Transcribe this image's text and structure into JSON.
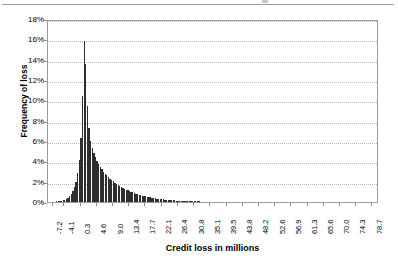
{
  "chart_data": {
    "type": "bar",
    "title": "",
    "xlabel": "Credit loss in millions",
    "ylabel": "Frequency of loss",
    "ylim": [
      0,
      18
    ],
    "ytick_labels": [
      "0%",
      "2%",
      "4%",
      "6%",
      "8%",
      "10%",
      "12%",
      "14%",
      "16%",
      "18%"
    ],
    "ytick_values": [
      0,
      2,
      4,
      6,
      8,
      10,
      12,
      14,
      16,
      18
    ],
    "grid": true,
    "legend": "none",
    "bar_color": "#2e2e2e",
    "xtick_labels": [
      "-7.2",
      "-4.1",
      "0.3",
      "4.6",
      "9.0",
      "13.4",
      "17.7",
      "22.1",
      "26.4",
      "30.8",
      "35.1",
      "39.5",
      "43.8",
      "48.2",
      "52.6",
      "56.9",
      "61.3",
      "65.6",
      "70.0",
      "74.3",
      "78.7"
    ],
    "xlim": [
      -8.5,
      80.5
    ],
    "x": [
      -7.9,
      -7.47,
      -7.03,
      -6.6,
      -6.16,
      -5.73,
      -5.29,
      -4.86,
      -4.42,
      -3.99,
      -3.55,
      -3.12,
      -2.68,
      -2.25,
      -1.81,
      -1.38,
      -0.94,
      -0.51,
      -0.07,
      0.36,
      0.8,
      1.23,
      1.67,
      2.1,
      2.54,
      2.97,
      3.41,
      3.84,
      4.28,
      4.71,
      5.15,
      5.58,
      6.02,
      6.45,
      6.89,
      7.32,
      7.76,
      8.19,
      8.63,
      9.06,
      9.5,
      9.93,
      10.37,
      10.8,
      11.24,
      11.67,
      12.11,
      12.54,
      12.98,
      13.41,
      13.85,
      14.28,
      14.72,
      15.15,
      15.59,
      16.02,
      16.46,
      16.89,
      17.33,
      17.76,
      18.2,
      18.63,
      19.07,
      19.5,
      19.94,
      20.37,
      20.81,
      21.24,
      21.68,
      22.11,
      22.55,
      22.98,
      23.42,
      23.85,
      24.29,
      24.72,
      25.16,
      25.59,
      26.03,
      26.46,
      26.9,
      27.33,
      27.77,
      28.2,
      28.64,
      29.07,
      29.51,
      29.94,
      30.38,
      30.81,
      31.25,
      31.68,
      32.12,
      32.55,
      32.99,
      33.42,
      33.86,
      34.29,
      34.73,
      35.16,
      35.6,
      36.03,
      36.47,
      36.9,
      37.34,
      37.77,
      38.21,
      38.64,
      39.08,
      39.51,
      39.95,
      40.38,
      40.82,
      41.25,
      41.69,
      42.12,
      42.56,
      42.99,
      43.43,
      43.86,
      44.3,
      44.73,
      45.17,
      45.6,
      46.04,
      46.47,
      46.91,
      47.34,
      47.78,
      48.21,
      48.65,
      49.08,
      49.52,
      49.95,
      50.39,
      50.82,
      51.26,
      51.69,
      52.13,
      52.56,
      53.0,
      53.43,
      53.87,
      54.3,
      54.74,
      55.17,
      55.61,
      56.04,
      56.48,
      56.91,
      57.35,
      57.78,
      58.22,
      58.65,
      59.09,
      59.52,
      59.96,
      60.39,
      60.83,
      61.26,
      61.7,
      62.13,
      62.57,
      63.0,
      63.44,
      63.87,
      64.31,
      64.74,
      65.18,
      65.61,
      66.05,
      66.48,
      66.92,
      67.35,
      67.79,
      68.22,
      68.66,
      69.09,
      69.53,
      69.96,
      70.4,
      70.83,
      71.27,
      71.7,
      72.14,
      72.57,
      73.01,
      73.44,
      73.88,
      74.31,
      74.75,
      75.18,
      75.62,
      76.05,
      76.49,
      76.92,
      77.36,
      77.79,
      78.23,
      78.66
    ],
    "values": [
      0.02,
      0.03,
      0.04,
      0.05,
      0.06,
      0.08,
      0.1,
      0.13,
      0.17,
      0.22,
      0.3,
      0.4,
      0.55,
      0.75,
      1.05,
      1.45,
      2.0,
      2.85,
      4.1,
      6.3,
      10.4,
      15.8,
      13.6,
      9.4,
      7.3,
      6.0,
      5.3,
      4.8,
      4.4,
      4.05,
      3.75,
      3.45,
      3.2,
      3.0,
      2.8,
      2.62,
      2.45,
      2.3,
      2.15,
      2.02,
      1.9,
      1.78,
      1.67,
      1.57,
      1.47,
      1.38,
      1.3,
      1.22,
      1.14,
      1.07,
      1.0,
      0.94,
      0.88,
      0.82,
      0.77,
      0.72,
      0.67,
      0.63,
      0.59,
      0.55,
      0.51,
      0.48,
      0.45,
      0.42,
      0.39,
      0.36,
      0.34,
      0.31,
      0.29,
      0.27,
      0.25,
      0.24,
      0.22,
      0.2,
      0.19,
      0.18,
      0.16,
      0.15,
      0.14,
      0.13,
      0.12,
      0.115,
      0.108,
      0.1,
      0.094,
      0.088,
      0.082,
      0.076,
      0.071,
      0.066,
      0.062,
      0.058,
      0.054,
      0.05,
      0.047,
      0.044,
      0.041,
      0.038,
      0.035,
      0.033,
      0.031,
      0.029,
      0.027,
      0.025,
      0.023,
      0.022,
      0.02,
      0.019,
      0.018,
      0.017,
      0.016,
      0.015,
      0.014,
      0.013,
      0.012,
      0.011,
      0.011,
      0.01,
      0.009,
      0.009,
      0.008,
      0.008,
      0.007,
      0.007,
      0.006,
      0.006,
      0.006,
      0.005,
      0.005,
      0.005,
      0.004,
      0.004,
      0.004,
      0.004,
      0.003,
      0.003,
      0.003,
      0.003,
      0.003,
      0.002,
      0.002,
      0.002,
      0.002,
      0.002,
      0.002,
      0.002,
      0.002,
      0.001,
      0.001,
      0.001,
      0.001,
      0.001,
      0.001,
      0.001,
      0.001,
      0.001,
      0.001,
      0.001,
      0.001,
      0.001,
      0.001,
      0.001,
      0.001,
      0.001,
      0.001,
      0.001,
      0.001,
      0.001,
      0.001,
      0.001,
      0.001,
      0.001,
      0.001,
      0.001,
      0.001,
      0.001,
      0.001,
      0.001,
      0.001,
      0.001,
      0.001,
      0.001,
      0.001,
      0.001,
      0.001,
      0.001,
      0.001,
      0.001,
      0.001,
      0.001,
      0.001,
      0.001,
      0.001,
      0.001,
      0.001,
      0.001,
      0.001,
      0.001,
      0.001,
      0.001
    ]
  }
}
